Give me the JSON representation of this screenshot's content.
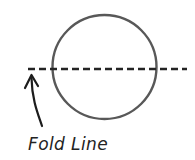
{
  "figure": {
    "width": 195,
    "height": 160,
    "background_color": "#ffffff"
  },
  "labels": {
    "fold_line": "Fold Line"
  },
  "colors": {
    "circle_stroke": "#585858",
    "fold_line_stroke": "#242424",
    "arrow_stroke": "#1c1c1c",
    "text": "#232323"
  },
  "shapes": {
    "circle": {
      "name": "circle-outline",
      "center_x": 104.5,
      "center_y": 67,
      "radius": 52,
      "stroke_width": 2.4,
      "fill": "none"
    },
    "fold_line": {
      "name": "fold-line-dashed",
      "x1": 28,
      "x2": 187,
      "y": 69,
      "stroke_width": 2.6,
      "dash_length": 7,
      "gap_length": 4
    },
    "arrow": {
      "name": "fold-direction-arrow",
      "path": "M 42 126 C 38 114, 32 100, 31.5 78",
      "tip_x": 31.5,
      "tip_y": 75,
      "head_left_x": 25,
      "head_left_y": 88,
      "head_right_x": 38,
      "head_right_y": 86,
      "stroke_width": 2.2
    },
    "label_position": {
      "x": 28,
      "y": 150
    }
  }
}
